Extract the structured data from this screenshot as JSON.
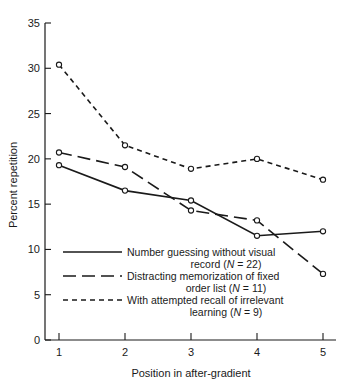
{
  "chart_data": {
    "type": "line",
    "title": "",
    "xlabel": "Position in after-gradient",
    "ylabel": "Percent repetition",
    "x": [
      1,
      2,
      3,
      4,
      5
    ],
    "categories": [
      "1",
      "2",
      "3",
      "4",
      "5"
    ],
    "xtick_labels": [
      "1",
      "2",
      "3",
      "4",
      "5"
    ],
    "ytick_labels": [
      "0",
      "5",
      "10",
      "15",
      "20",
      "25",
      "30",
      "35"
    ],
    "yticks": [
      0,
      5,
      10,
      15,
      20,
      25,
      30,
      35
    ],
    "xlim": [
      0.7,
      5.35
    ],
    "ylim": [
      0,
      35
    ],
    "grid": false,
    "legend_position": "lower-left-inside",
    "series": [
      {
        "name": "Number guessing without visual record (N = 22)",
        "label_line1": "Number guessing without visual",
        "label_line2_pre": "record (",
        "label_line2_n": "N",
        "label_line2_post": " = 22)",
        "n": 22,
        "style": "solid",
        "values": [
          19.3,
          16.5,
          15.4,
          11.5,
          12.0
        ]
      },
      {
        "name": "Distracting memorization of fixed order list (N = 11)",
        "label_line1": "Distracting memorization of fixed",
        "label_line2_pre": "order list (",
        "label_line2_n": "N",
        "label_line2_post": " = 11)",
        "n": 11,
        "style": "long-dash",
        "values": [
          20.7,
          19.1,
          14.3,
          13.2,
          7.3
        ]
      },
      {
        "name": "With attempted recall of irrelevant learning (N = 9)",
        "label_line1": "With attempted recall of irrelevant",
        "label_line2_pre": "learning (",
        "label_line2_n": "N",
        "label_line2_post": " = 9)",
        "n": 9,
        "style": "short-dash",
        "values": [
          30.4,
          21.5,
          18.9,
          20.0,
          17.7
        ]
      }
    ],
    "colors": {
      "ink": "#1a1a1a",
      "background": "#ffffff",
      "marker_fill": "#ffffff"
    }
  }
}
